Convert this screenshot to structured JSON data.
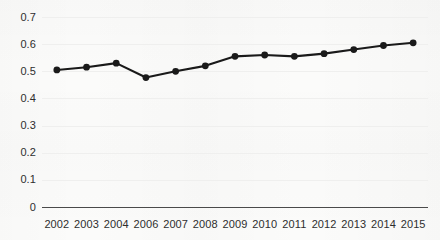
{
  "chart_data": {
    "type": "line",
    "title": "",
    "subtitle": "",
    "xlabel": "",
    "ylabel": "",
    "categories": [
      "2002",
      "2003",
      "2004",
      "2006",
      "2007",
      "2008",
      "2009",
      "2010",
      "2011",
      "2012",
      "2013",
      "2014",
      "2015"
    ],
    "series": [
      {
        "name": "",
        "values": [
          0.505,
          0.515,
          0.53,
          0.477,
          0.5,
          0.52,
          0.555,
          0.56,
          0.555,
          0.565,
          0.58,
          0.595,
          0.605
        ]
      }
    ],
    "ylim": [
      0,
      0.7
    ],
    "yticks": [
      "0",
      "0.1",
      "0.2",
      "0.3",
      "0.4",
      "0.5",
      "0.6",
      "0.7"
    ],
    "ytick_values": [
      0,
      0.1,
      0.2,
      0.3,
      0.4,
      0.5,
      0.6,
      0.7
    ],
    "grid": true,
    "grid_axis": "y",
    "legend": false,
    "legend_position": "none",
    "annotations": [],
    "marker": "circle",
    "line_color": "#1a1a1a",
    "marker_color": "#1a1a1a",
    "grid_color": "#efefee",
    "axis_color": "#4a4a4a",
    "background_color": "#fbfbfa",
    "text_color": "#2e2e2e"
  }
}
